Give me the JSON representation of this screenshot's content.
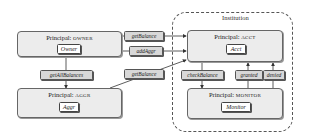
{
  "institution": {
    "label": "Institution"
  },
  "principals": {
    "owner": {
      "prefix": "Principal:",
      "name": "OWNER",
      "object": "Owner"
    },
    "aggr": {
      "prefix": "Principal:",
      "name": "AGGR",
      "object": "Aggr"
    },
    "acct": {
      "prefix": "Principal:",
      "name": "ACCT",
      "object": "Acct"
    },
    "monitor": {
      "prefix": "Principal:",
      "name": "MONITOR",
      "object": "Monitor"
    }
  },
  "messages": {
    "get_balance_owner": "getBalance",
    "add_aggr": "addAggr",
    "get_balance_aggr": "getBalance",
    "get_all_balances": "getAllBalances",
    "check_balance": "checkBalance",
    "granted": "granted",
    "denied": "denied"
  },
  "colors": {
    "principal_fill": "#ececec",
    "message_fill": "#d8d8d8",
    "stroke": "#555555"
  }
}
